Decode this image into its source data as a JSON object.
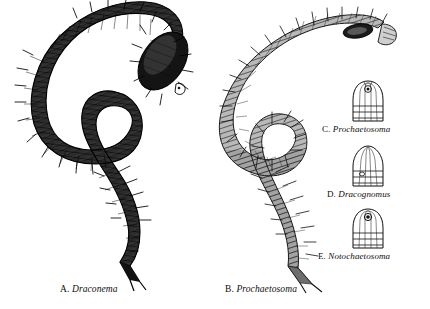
{
  "figure": {
    "background_color": "#ffffff",
    "ink_color": "#101010",
    "kind": "scientific-illustration-plate"
  },
  "captions": [
    {
      "id": "a",
      "letter": "A.",
      "genus": "Draconema"
    },
    {
      "id": "b",
      "letter": "B.",
      "genus": "Prochaetosoma"
    },
    {
      "id": "c",
      "letter": "C.",
      "genus": "Prochaetosoma"
    },
    {
      "id": "d",
      "letter": "D.",
      "genus": "Dracognomus"
    },
    {
      "id": "e",
      "letter": "E.",
      "genus": "Notochaetosoma"
    }
  ],
  "specimens": [
    {
      "id": "a",
      "name": "Draconema",
      "type": "whole-body",
      "tone": "dark",
      "description": "S-curved nematode, heavily inked, dense cross-hatching, bulbous dark head capsule with white oral opening, bristles along body, forked tail tip"
    },
    {
      "id": "b",
      "name": "Prochaetosoma",
      "type": "whole-body",
      "tone": "medium",
      "description": "S-curved nematode, lighter grey hatching with annulation bands, head at upper right with dark amphid, long bristles, tapering split tail"
    },
    {
      "id": "c",
      "name": "Prochaetosoma",
      "type": "head-capsule-detail",
      "tone": "light",
      "apex": "rounded-dome",
      "amphid": "circular-spiral-upper",
      "rings": 3
    },
    {
      "id": "d",
      "name": "Dracognomus",
      "type": "head-capsule-detail",
      "tone": "light",
      "apex": "pointed-conical",
      "amphid": "small-oval-lower",
      "rings": 3
    },
    {
      "id": "e",
      "name": "Notochaetosoma",
      "type": "head-capsule-detail",
      "tone": "light",
      "apex": "rounded-dome",
      "amphid": "circular-upper",
      "rings": 3
    }
  ]
}
